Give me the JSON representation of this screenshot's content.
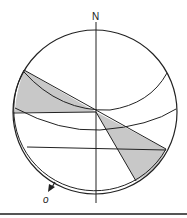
{
  "diagram": {
    "type": "stereonet-projection",
    "north_label": "N",
    "arrow_label": "o",
    "colors": {
      "line": "#222222",
      "shade": "#c8c8c8",
      "rule": "#555555"
    }
  }
}
